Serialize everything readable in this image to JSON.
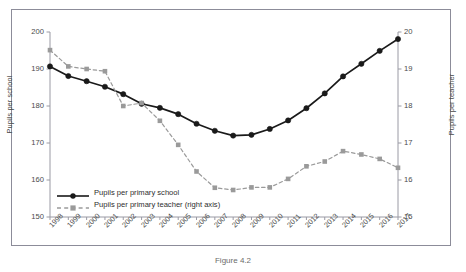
{
  "figure": {
    "caption": "Figure 4.2",
    "border_color": "#8c8c99"
  },
  "chart_data": {
    "type": "line",
    "title": "",
    "xlabel": "",
    "ylabel": "Pupils per school",
    "y2label": "Pupils per teacher",
    "grid": false,
    "legend_position": "lower-left",
    "ylim": [
      150,
      200
    ],
    "y2lim": [
      15,
      20
    ],
    "yticks": [
      "150",
      "160",
      "170",
      "180",
      "190",
      "200"
    ],
    "y2ticks": [
      "15",
      "16",
      "17",
      "18",
      "19",
      "20"
    ],
    "categories": [
      "1998",
      "1999",
      "2000",
      "2001",
      "2002",
      "2003",
      "2004",
      "2005",
      "2006",
      "2007",
      "2008",
      "2009",
      "2010",
      "2011",
      "2012",
      "2013",
      "2014",
      "2015",
      "2016",
      "2017"
    ],
    "series": [
      {
        "name": "Pupils per primary school",
        "axis": "left",
        "color": "#1a1a1a",
        "style": "solid",
        "marker": "circle",
        "values": [
          190.7,
          188.1,
          186.7,
          185.2,
          183.2,
          180.6,
          179.5,
          177.8,
          175.2,
          173.3,
          172.0,
          172.2,
          173.8,
          176.1,
          179.4,
          183.4,
          188.0,
          191.4,
          194.9,
          198.1
        ]
      },
      {
        "name": "Pupils per primary teacher (right axis)",
        "axis": "right",
        "color": "#9a9a9a",
        "style": "dashed",
        "marker": "square",
        "values": [
          19.51,
          19.07,
          19.0,
          18.94,
          18.0,
          18.08,
          17.6,
          16.95,
          16.23,
          15.79,
          15.73,
          15.8,
          15.8,
          16.03,
          16.37,
          16.5,
          16.78,
          16.69,
          16.57,
          16.33
        ]
      }
    ]
  }
}
